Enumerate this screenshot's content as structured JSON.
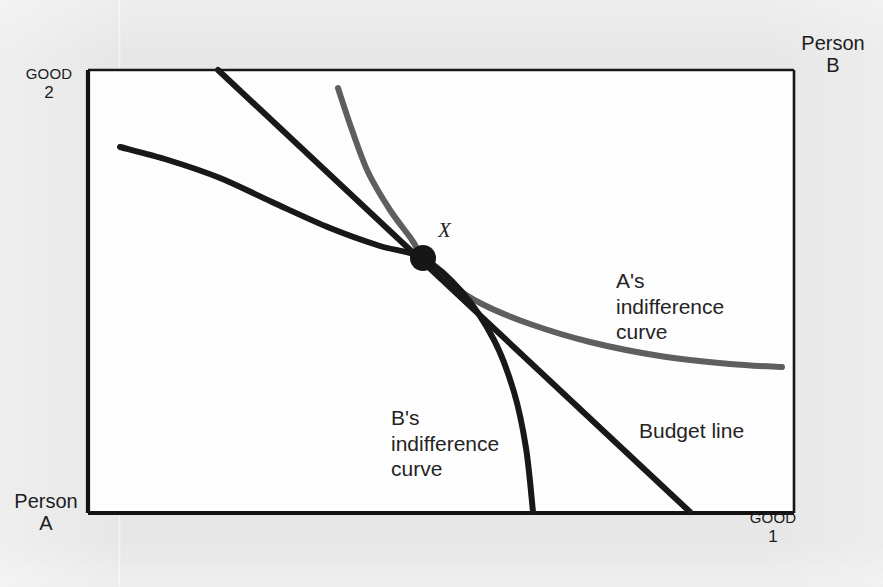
{
  "figure": {
    "kind": "economics-indifference-curve-diagram",
    "background_color": "#e8e8e8",
    "plot_background_color": "#ffffff",
    "frame_color": "#111111"
  },
  "axes": {
    "top_left": {
      "line1": "GOOD",
      "line2": "2",
      "name": "good-2-axis-label"
    },
    "top_right": {
      "line1": "Person",
      "line2": "B",
      "name": "person-b-label"
    },
    "bottom_left": {
      "line1": "Person",
      "line2": "A",
      "name": "person-a-label"
    },
    "bottom_right": {
      "line1": "GOOD",
      "line2": "1",
      "name": "good-1-axis-label"
    }
  },
  "annotations": {
    "a_curve": "A's\nindifference\ncurve",
    "b_curve": "B's\nindifference\ncurve",
    "budget_line": "Budget line",
    "tangency_point": "X"
  },
  "chart_data": {
    "type": "line",
    "title": "",
    "xlabel": "GOOD 1",
    "ylabel": "GOOD 2",
    "grid": false,
    "legend": "inline-annotations",
    "frame": {
      "x": 88,
      "y": 70,
      "width": 706,
      "height": 443
    },
    "series": [
      {
        "name": "A's indifference curve",
        "color": "#5e5e5e",
        "width": 6,
        "convexity": "convex-to-origin-A (lower-left)",
        "points": [
          [
            338,
            88
          ],
          [
            352,
            130
          ],
          [
            368,
            172
          ],
          [
            390,
            210
          ],
          [
            412,
            240
          ],
          [
            423,
            258
          ],
          [
            448,
            282
          ],
          [
            482,
            304
          ],
          [
            530,
            324
          ],
          [
            590,
            342
          ],
          [
            660,
            356
          ],
          [
            730,
            364
          ],
          [
            782,
            367
          ]
        ]
      },
      {
        "name": "B's indifference curve",
        "color": "#171717",
        "width": 6,
        "convexity": "convex-to-origin-B (upper-right)",
        "points": [
          [
            120,
            147
          ],
          [
            168,
            160
          ],
          [
            220,
            178
          ],
          [
            272,
            202
          ],
          [
            330,
            228
          ],
          [
            380,
            246
          ],
          [
            423,
            258
          ],
          [
            462,
            292
          ],
          [
            494,
            340
          ],
          [
            514,
            392
          ],
          [
            526,
            448
          ],
          [
            533,
            512
          ]
        ]
      },
      {
        "name": "Budget line",
        "color": "#171717",
        "width": 6,
        "shape": "straight",
        "points": [
          [
            218,
            70
          ],
          [
            423,
            258
          ],
          [
            690,
            512
          ]
        ]
      }
    ],
    "markers": [
      {
        "name": "tangency-point",
        "label": "X",
        "x": 423,
        "y": 258,
        "radius": 13,
        "color": "#141414"
      }
    ]
  }
}
